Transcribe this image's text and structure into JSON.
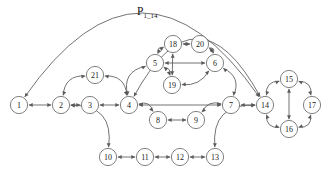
{
  "diagram": {
    "title": {
      "base": "P",
      "subscript": "1_14",
      "full": "P1_14",
      "x": 137,
      "y": 15
    },
    "canvas": {
      "width": 332,
      "height": 177
    },
    "style": {
      "node_fill": "#ffffff",
      "node_stroke": "#6b6b6b",
      "edge_stroke": "#5a5a5a",
      "label_color": "#1a1a1a",
      "background": "#ffffff",
      "node_radius": 8.6,
      "stroke_width": 0.85,
      "arrow_size": 2.6
    },
    "nodes": [
      {
        "id": "1",
        "label": "1",
        "cx": 19,
        "cy": 105
      },
      {
        "id": "2",
        "label": "2",
        "cx": 61,
        "cy": 105
      },
      {
        "id": "3",
        "label": "3",
        "cx": 90,
        "cy": 105
      },
      {
        "id": "4",
        "label": "4",
        "cx": 129,
        "cy": 105
      },
      {
        "id": "5",
        "label": "5",
        "cx": 155,
        "cy": 63
      },
      {
        "id": "6",
        "label": "6",
        "cx": 215,
        "cy": 63
      },
      {
        "id": "7",
        "label": "7",
        "cx": 231,
        "cy": 105
      },
      {
        "id": "8",
        "label": "8",
        "cx": 158,
        "cy": 120
      },
      {
        "id": "9",
        "label": "9",
        "cx": 196,
        "cy": 120
      },
      {
        "id": "10",
        "label": "10",
        "cx": 108,
        "cy": 157
      },
      {
        "id": "11",
        "label": "11",
        "cx": 145,
        "cy": 157
      },
      {
        "id": "12",
        "label": "12",
        "cx": 180,
        "cy": 157
      },
      {
        "id": "13",
        "label": "13",
        "cx": 215,
        "cy": 157
      },
      {
        "id": "14",
        "label": "14",
        "cx": 265,
        "cy": 105
      },
      {
        "id": "15",
        "label": "15",
        "cx": 289,
        "cy": 79
      },
      {
        "id": "16",
        "label": "16",
        "cx": 289,
        "cy": 129
      },
      {
        "id": "17",
        "label": "17",
        "cx": 312,
        "cy": 105
      },
      {
        "id": "18",
        "label": "18",
        "cx": 173,
        "cy": 44
      },
      {
        "id": "19",
        "label": "19",
        "cx": 172,
        "cy": 85
      },
      {
        "id": "20",
        "label": "20",
        "cx": 200,
        "cy": 44
      },
      {
        "id": "21",
        "label": "21",
        "cx": 95,
        "cy": 75
      }
    ],
    "edges": [
      {
        "from": "1",
        "to": "14",
        "kind": "arc",
        "bow": -88,
        "directed": "both",
        "name": "edge-1-14-outer"
      },
      {
        "from": "1",
        "to": "2",
        "kind": "line",
        "directed": "both",
        "name": "edge-1-2"
      },
      {
        "from": "2",
        "to": "3",
        "kind": "line",
        "directed": "both",
        "name": "edge-2-3"
      },
      {
        "from": "2",
        "to": "21",
        "kind": "arc",
        "bow": -10,
        "directed": "both",
        "name": "edge-2-21"
      },
      {
        "from": "21",
        "to": "4",
        "kind": "arc",
        "bow": -10,
        "directed": "both",
        "name": "edge-21-4"
      },
      {
        "from": "2",
        "to": "10",
        "kind": "arc",
        "bow": -20,
        "directed": "both",
        "name": "edge-2-10"
      },
      {
        "from": "3",
        "to": "4",
        "kind": "line",
        "directed": "both",
        "name": "edge-3-4"
      },
      {
        "from": "4",
        "to": "5",
        "kind": "arc",
        "bow": -12,
        "directed": "both",
        "name": "edge-4-5"
      },
      {
        "from": "4",
        "to": "7",
        "kind": "line",
        "directed": "both",
        "name": "edge-4-7"
      },
      {
        "from": "4",
        "to": "8",
        "kind": "arc",
        "bow": -7,
        "directed": "both",
        "name": "edge-4-8"
      },
      {
        "from": "8",
        "to": "9",
        "kind": "line",
        "directed": "both",
        "name": "edge-8-9"
      },
      {
        "from": "9",
        "to": "7",
        "kind": "arc",
        "bow": -7,
        "directed": "both",
        "name": "edge-9-7"
      },
      {
        "from": "5",
        "to": "18",
        "kind": "arc",
        "bow": -5,
        "directed": "both",
        "name": "edge-5-18"
      },
      {
        "from": "5",
        "to": "19",
        "kind": "arc",
        "bow": -5,
        "directed": "both",
        "name": "edge-5-19"
      },
      {
        "from": "5",
        "to": "6",
        "kind": "line",
        "directed": "both",
        "name": "edge-5-6"
      },
      {
        "from": "18",
        "to": "20",
        "kind": "line",
        "directed": "both",
        "name": "edge-18-20"
      },
      {
        "from": "18",
        "to": "19",
        "kind": "line",
        "directed": "both",
        "name": "edge-18-19"
      },
      {
        "from": "20",
        "to": "6",
        "kind": "arc",
        "bow": -5,
        "directed": "both",
        "name": "edge-20-6"
      },
      {
        "from": "19",
        "to": "6",
        "kind": "arc",
        "bow": 7,
        "directed": "both",
        "name": "edge-19-6"
      },
      {
        "from": "6",
        "to": "7",
        "kind": "arc",
        "bow": -10,
        "directed": "both",
        "name": "edge-6-7"
      },
      {
        "from": "7",
        "to": "14",
        "kind": "line",
        "directed": "both",
        "name": "edge-7-14"
      },
      {
        "from": "10",
        "to": "11",
        "kind": "line",
        "directed": "both",
        "name": "edge-10-11"
      },
      {
        "from": "11",
        "to": "12",
        "kind": "line",
        "directed": "both",
        "name": "edge-11-12"
      },
      {
        "from": "12",
        "to": "13",
        "kind": "line",
        "directed": "both",
        "name": "edge-12-13"
      },
      {
        "from": "13",
        "to": "14",
        "kind": "arc",
        "bow": -20,
        "directed": "both",
        "name": "edge-13-14"
      },
      {
        "from": "4",
        "to": "14",
        "kind": "arc",
        "bow": -62,
        "directed": "both",
        "name": "edge-4-14-outer"
      },
      {
        "from": "14",
        "to": "15",
        "kind": "arc",
        "bow": -8,
        "directed": "both",
        "name": "edge-14-15"
      },
      {
        "from": "15",
        "to": "17",
        "kind": "arc",
        "bow": -8,
        "directed": "both",
        "name": "edge-15-17"
      },
      {
        "from": "17",
        "to": "16",
        "kind": "arc",
        "bow": -8,
        "directed": "both",
        "name": "edge-17-16"
      },
      {
        "from": "16",
        "to": "14",
        "kind": "arc",
        "bow": -8,
        "directed": "both",
        "name": "edge-16-14"
      },
      {
        "from": "15",
        "to": "16",
        "kind": "line",
        "directed": "both",
        "name": "edge-15-16"
      }
    ]
  }
}
